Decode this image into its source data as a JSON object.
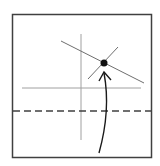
{
  "diagram": {
    "title": "Fold diagram step",
    "colors": {
      "frame": "#404040",
      "guide": "#a0a0a0",
      "crease": "#6e6e6e",
      "dashed": "#404040",
      "dot": "#111111",
      "arrow": "#1a1a1a"
    },
    "frame": {
      "x": 12.5,
      "y": 14.5,
      "width": 139,
      "height": 143
    },
    "guides": {
      "vertical": {
        "x1": 81,
        "y1": 34,
        "x2": 81,
        "y2": 140
      },
      "horizontal": {
        "x1": 22,
        "y1": 88,
        "x2": 141,
        "y2": 88
      }
    },
    "creases": {
      "long_diagonal": {
        "x1": 61,
        "y1": 41,
        "x2": 144,
        "y2": 83
      },
      "short_diagonal": {
        "x1": 118,
        "y1": 47,
        "x2": 88,
        "y2": 79
      }
    },
    "dashed_line": {
      "x1": 13,
      "y1": 111,
      "x2": 151,
      "y2": 111,
      "dash": "7 4"
    },
    "reference_point": {
      "cx": 104,
      "cy": 63,
      "r": 3.5
    },
    "arrow": {
      "path": "M 99 153 C 104 135, 110 105, 104 73",
      "head": "M 99 81 L 104 72 L 111 80",
      "label": "fold up to point"
    }
  }
}
